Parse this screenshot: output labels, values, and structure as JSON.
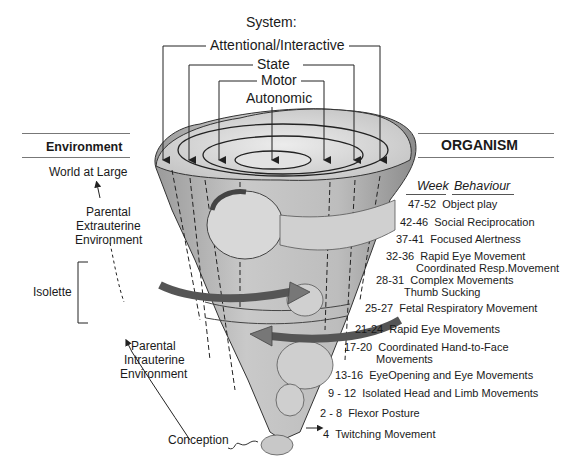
{
  "system": {
    "title": "System:",
    "levels": [
      {
        "label": "Attentional/Interactive"
      },
      {
        "label": "State"
      },
      {
        "label": "Motor"
      },
      {
        "label": "Autonomic"
      }
    ]
  },
  "environment": {
    "header": "Environment",
    "items": [
      {
        "label": "World at Large"
      },
      {
        "label": "Parental\nExtrauterine\nEnvironment",
        "lines": [
          "Parental",
          "Extrauterine",
          "Environment"
        ]
      },
      {
        "label": "Isolette"
      },
      {
        "label": "Parental\nIntrauterine\nEnvironment",
        "lines": [
          "Parental",
          "Intrauterine",
          "Environment"
        ]
      },
      {
        "label": "Conception"
      }
    ]
  },
  "organism": {
    "header": "ORGANISM",
    "columns": {
      "week": "Week",
      "behaviour": "Behaviour"
    },
    "rows": [
      {
        "week": "47-52",
        "behaviour": "Object play"
      },
      {
        "week": "42-46",
        "behaviour": "Social Reciprocation"
      },
      {
        "week": "37-41",
        "behaviour": "Focused Alertness"
      },
      {
        "week": "32-36",
        "behaviour": "Rapid Eye Movement",
        "behaviour2": "Coordinated Resp.Movement"
      },
      {
        "week": "28-31",
        "behaviour": "Complex Movements",
        "behaviour2": "Thumb Sucking"
      },
      {
        "week": "25-27",
        "behaviour": "Fetal Respiratory Movement"
      },
      {
        "week": "21-24",
        "behaviour": "Rapid Eye Movements"
      },
      {
        "week": "17-20",
        "behaviour": "Coordinated Hand-to-Face",
        "behaviour2": "Movements"
      },
      {
        "week": "13-16",
        "behaviour": "EyeOpening and Eye Movements"
      },
      {
        "week": "9 - 12",
        "behaviour": "Isolated Head and Limb Movements"
      },
      {
        "week": "2 - 8",
        "behaviour": "Flexor Posture"
      },
      {
        "week": "4",
        "behaviour": "Twitching Movement"
      }
    ]
  },
  "colors": {
    "cone_fill": "#b8b8b8",
    "cone_light": "#d6d6d6",
    "arrow_band": "#6e6e6e",
    "line": "#222222",
    "rule": "#777777"
  }
}
